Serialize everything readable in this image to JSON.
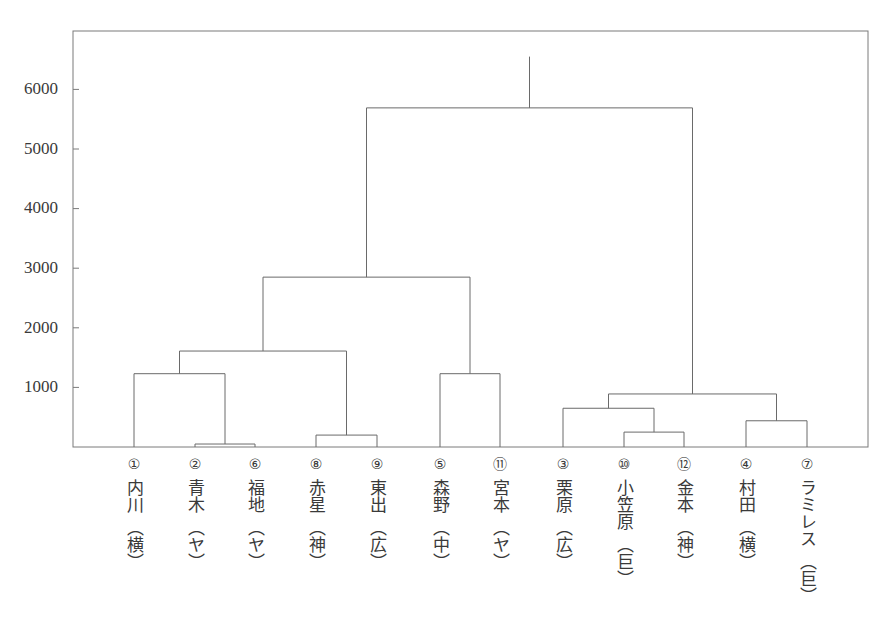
{
  "chart_data": {
    "type": "dendrogram",
    "title": "",
    "xlabel": "",
    "ylabel": "",
    "ylim": [
      0,
      7000
    ],
    "yticks": [
      1000,
      2000,
      3000,
      4000,
      5000,
      6000
    ],
    "grid": false,
    "leaves": [
      {
        "num": "①",
        "name": "内川",
        "team": "（横）"
      },
      {
        "num": "②",
        "name": "青木",
        "team": "（ヤ）"
      },
      {
        "num": "⑥",
        "name": "福地",
        "team": "（ヤ）"
      },
      {
        "num": "⑧",
        "name": "赤星",
        "team": "（神）"
      },
      {
        "num": "⑨",
        "name": "東出",
        "team": "（広）"
      },
      {
        "num": "⑤",
        "name": "森野",
        "team": "（中）"
      },
      {
        "num": "⑪",
        "name": "宮本",
        "team": "（ヤ）"
      },
      {
        "num": "③",
        "name": "栗原",
        "team": "（広）"
      },
      {
        "num": "⑩",
        "name": "小笠原",
        "team": "（巨）"
      },
      {
        "num": "⑫",
        "name": "金本",
        "team": "（神）"
      },
      {
        "num": "④",
        "name": "村田",
        "team": "（横）"
      },
      {
        "num": "⑦",
        "name": "ラミレス",
        "team": "（巨）"
      }
    ],
    "merges": [
      {
        "members": [
          "②",
          "⑥"
        ],
        "height": 50
      },
      {
        "members": [
          "⑧",
          "⑨"
        ],
        "height": 200
      },
      {
        "members": [
          "⑩",
          "⑫"
        ],
        "height": 250
      },
      {
        "members": [
          "④",
          "⑦"
        ],
        "height": 440
      },
      {
        "members": [
          "③",
          "⑩⑫"
        ],
        "height": 650
      },
      {
        "members": [
          "③⑩⑫",
          "④⑦"
        ],
        "height": 890
      },
      {
        "members": [
          "①",
          "②⑥"
        ],
        "height": 1230
      },
      {
        "members": [
          "⑤",
          "⑪"
        ],
        "height": 1230
      },
      {
        "members": [
          "①②⑥",
          "⑧⑨"
        ],
        "height": 1610
      },
      {
        "members": [
          "①②⑥⑧⑨",
          "⑤⑪"
        ],
        "height": 2850
      },
      {
        "members": [
          "①②⑥⑧⑨⑤⑪",
          "③⑩⑫④⑦"
        ],
        "height": 5690
      }
    ],
    "root_line_top": 6550
  },
  "axis": {
    "yticks": [
      "1000",
      "2000",
      "3000",
      "4000",
      "5000",
      "6000"
    ]
  }
}
